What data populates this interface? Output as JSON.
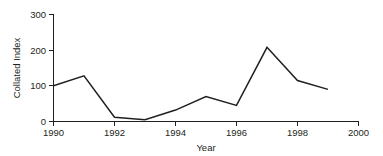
{
  "chart_data": {
    "type": "line",
    "title": "",
    "xlabel": "Year",
    "ylabel": "Collated Index",
    "x": [
      1990,
      1991,
      1992,
      1993,
      1994,
      1995,
      1996,
      1997,
      1998,
      1999
    ],
    "values": [
      100,
      128,
      12,
      5,
      32,
      70,
      45,
      208,
      115,
      90
    ],
    "series": [
      {
        "name": "Collated Index",
        "values": [
          100,
          128,
          12,
          5,
          32,
          70,
          45,
          208,
          115,
          90
        ]
      }
    ],
    "xlim": [
      1990,
      2000
    ],
    "ylim": [
      0,
      300
    ],
    "xticks": [
      1990,
      1992,
      1994,
      1996,
      1998,
      2000
    ],
    "xtick_labels": [
      "1990",
      "1992",
      "1994",
      "1996",
      "1998",
      "2000"
    ],
    "yticks": [
      0,
      100,
      200,
      300
    ],
    "ytick_labels": [
      "0",
      "100",
      "200",
      "300"
    ],
    "grid": false,
    "legend": "none",
    "line_color": "#231f20",
    "background_color": "#ffffff"
  },
  "axes": {
    "y_label": "Collated Index",
    "x_label": "Year",
    "y_ticks": [
      {
        "value": "300"
      },
      {
        "value": "200"
      },
      {
        "value": "100"
      },
      {
        "value": "0"
      }
    ],
    "x_ticks": [
      {
        "value": "1990"
      },
      {
        "value": "1992"
      },
      {
        "value": "1994"
      },
      {
        "value": "1996"
      },
      {
        "value": "1998"
      },
      {
        "value": "2000"
      }
    ]
  }
}
